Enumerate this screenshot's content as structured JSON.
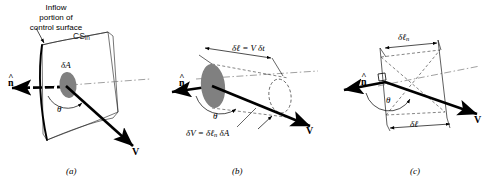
{
  "figure": {
    "title_text": "Inflow portion of control surface with differential area, velocity vector, and swept volume",
    "background_color": "#ffffff",
    "ink_color": "#000000",
    "ellipse_fill": "#808080"
  },
  "panels": [
    {
      "id": "a",
      "caption": "(a)",
      "labels": {
        "inflow_line1": "Inflow",
        "inflow_line2": "portion of",
        "inflow_line3": "control surface",
        "cs_in_base": "CS",
        "cs_in_sub": "in",
        "delta_a": "δA",
        "theta": "θ",
        "n_hat": "n",
        "n_hat_accent": "^",
        "velocity": "V"
      }
    },
    {
      "id": "b",
      "caption": "(b)",
      "labels": {
        "n_hat": "n",
        "n_hat_accent": "^",
        "theta": "θ",
        "velocity": "V",
        "length_eq_lhs": "δℓ",
        "length_eq_rhs": " = V δt",
        "volume_eq_lhs": "δV",
        "volume_eq_mid": " = δℓ",
        "volume_eq_sub": "n",
        "volume_eq_rhs": " δA"
      }
    },
    {
      "id": "c",
      "caption": "(c)",
      "labels": {
        "n_hat": "n",
        "n_hat_accent": "^",
        "theta": "θ",
        "velocity": "V",
        "delta_ln_base": "δℓ",
        "delta_ln_sub": "n",
        "delta_l": "δℓ"
      }
    }
  ]
}
